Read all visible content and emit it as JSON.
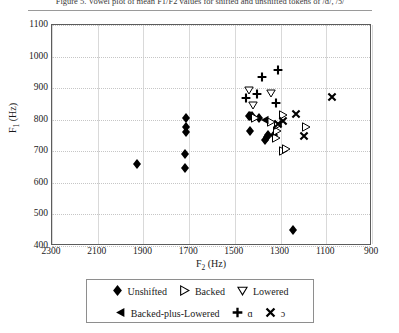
{
  "caption": {
    "text": "Figure 5. Vowel plot of mean F1/F2 values for shifted and unshifted tokens of /ɑ/, /ɔ/"
  },
  "chart_data": {
    "type": "scatter",
    "title": "",
    "xlabel": "F2 (Hz)",
    "ylabel": "F1 (Hz)",
    "xlim": [
      2300,
      900
    ],
    "ylim": [
      1100,
      400
    ],
    "x_reversed": true,
    "y_reversed": true,
    "xticks": [
      2300,
      2100,
      1900,
      1700,
      1500,
      1300,
      1100,
      900
    ],
    "yticks": [
      400,
      500,
      600,
      700,
      800,
      900,
      1000,
      1100
    ],
    "grid": true,
    "legend_position": "bottom",
    "series": [
      {
        "name": "Unshifted",
        "marker": "filled-diamond",
        "color": "#000000",
        "points": [
          {
            "x": 1247,
            "y": 452
          },
          {
            "x": 1930,
            "y": 661
          },
          {
            "x": 1718,
            "y": 648
          },
          {
            "x": 1716,
            "y": 690
          },
          {
            "x": 1714,
            "y": 762
          },
          {
            "x": 1714,
            "y": 777
          },
          {
            "x": 1712,
            "y": 805
          },
          {
            "x": 1434,
            "y": 764
          },
          {
            "x": 1368,
            "y": 735
          },
          {
            "x": 1360,
            "y": 745
          },
          {
            "x": 1356,
            "y": 752
          },
          {
            "x": 1330,
            "y": 752
          },
          {
            "x": 1440,
            "y": 812
          },
          {
            "x": 1432,
            "y": 812
          },
          {
            "x": 1424,
            "y": 812
          },
          {
            "x": 1396,
            "y": 806
          }
        ]
      },
      {
        "name": "Backed",
        "marker": "open-right-triangle",
        "color": "#000000",
        "points": [
          {
            "x": 1288,
            "y": 700
          },
          {
            "x": 1278,
            "y": 706
          },
          {
            "x": 1318,
            "y": 743
          },
          {
            "x": 1314,
            "y": 765
          },
          {
            "x": 1310,
            "y": 783
          },
          {
            "x": 1412,
            "y": 806
          },
          {
            "x": 1342,
            "y": 793
          },
          {
            "x": 1290,
            "y": 816
          },
          {
            "x": 1190,
            "y": 778
          }
        ]
      },
      {
        "name": "Lowered",
        "marker": "open-down-triangle",
        "color": "#000000",
        "points": [
          {
            "x": 1420,
            "y": 848
          },
          {
            "x": 1340,
            "y": 885
          },
          {
            "x": 1438,
            "y": 895
          }
        ]
      },
      {
        "name": "Backed-plus-Lowered",
        "marker": "filled-left-triangle",
        "color": "#000000",
        "points": [
          {
            "x": 1368,
            "y": 800
          }
        ]
      },
      {
        "name": "ɑ",
        "marker": "plus",
        "color": "#000000",
        "points": [
          {
            "x": 1450,
            "y": 870
          },
          {
            "x": 1318,
            "y": 852
          },
          {
            "x": 1404,
            "y": 880
          },
          {
            "x": 1380,
            "y": 935
          },
          {
            "x": 1312,
            "y": 958
          }
        ]
      },
      {
        "name": "ɔ",
        "marker": "x-cross",
        "color": "#000000",
        "points": [
          {
            "x": 1196,
            "y": 750
          },
          {
            "x": 1288,
            "y": 795
          },
          {
            "x": 1312,
            "y": 785
          },
          {
            "x": 1232,
            "y": 818
          },
          {
            "x": 1075,
            "y": 872
          }
        ]
      }
    ]
  },
  "legend": {
    "items": [
      {
        "label": "Unshifted",
        "marker": "filled-diamond"
      },
      {
        "label": "Backed",
        "marker": "open-right-triangle"
      },
      {
        "label": "Lowered",
        "marker": "open-down-triangle"
      },
      {
        "label": "Backed-plus-Lowered",
        "marker": "filled-left-triangle"
      },
      {
        "label": "ɑ",
        "marker": "plus"
      },
      {
        "label": "ɔ",
        "marker": "x-cross"
      }
    ]
  }
}
